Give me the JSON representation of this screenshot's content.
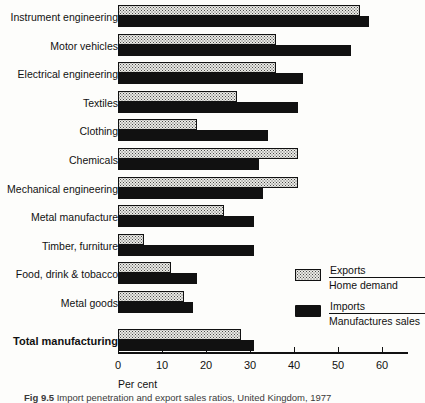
{
  "chart_data": {
    "type": "bar",
    "orientation": "horizontal",
    "title": "",
    "xlabel": "Per cent",
    "ylabel": "",
    "xlim": [
      0,
      65
    ],
    "xticks": [
      0,
      10,
      20,
      30,
      40,
      50,
      60
    ],
    "xtick_labels": [
      "0",
      "10",
      "20",
      "30",
      "40",
      "50",
      "60"
    ],
    "grid": false,
    "legend_position": "inside-right",
    "categories": [
      "Instrument engineering",
      "Motor vehicles",
      "Electrical engineering",
      "Textiles",
      "Clothing",
      "Chemicals",
      "Mechanical engineering",
      "Metal manufacture",
      "Timber, furniture",
      "Food, drink & tobacco",
      "Metal goods",
      "Total manufacturing"
    ],
    "emphasised_categories": [
      "Total manufacturing"
    ],
    "series": [
      {
        "name": "Exports",
        "sublabel": "Home demand",
        "style": "stippled",
        "color": "#e9e9e4",
        "values": [
          55,
          36,
          36,
          27,
          18,
          41,
          41,
          24,
          6,
          12,
          15,
          28
        ]
      },
      {
        "name": "Imports",
        "sublabel": "Manufactures sales",
        "style": "solid",
        "color": "#111111",
        "values": [
          57,
          53,
          42,
          41,
          34,
          32,
          33,
          31,
          31,
          18,
          17,
          31
        ]
      }
    ]
  },
  "axis": {
    "unit_label": "Per cent"
  },
  "legend": {
    "items": [
      {
        "name": "Exports",
        "numerator": "Exports",
        "denominator": "Home demand",
        "swatch": "exports-swatch"
      },
      {
        "name": "Imports",
        "numerator": "Imports",
        "denominator": "Manufactures sales",
        "swatch": "imports-swatch"
      }
    ]
  },
  "caption": {
    "figure_number": "Fig 9.5",
    "text": "Import penetration and export sales ratios, United Kingdom, 1977"
  }
}
